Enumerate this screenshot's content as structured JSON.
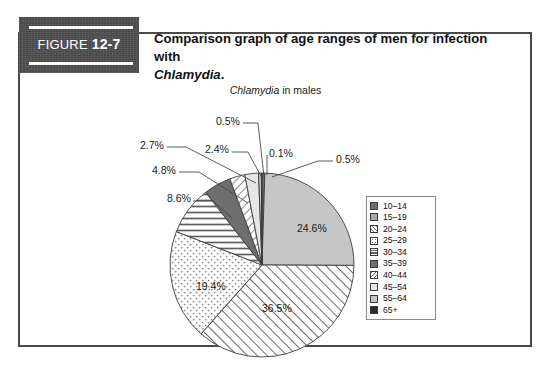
{
  "figure": {
    "tab_word": "FIGURE",
    "tab_number": "12-7",
    "caption_line1": "Comparison graph of age ranges of men for infection with",
    "caption_italic": "Chlamydia",
    "caption_end": "."
  },
  "chart_title": {
    "italic_part": "Chlamydia",
    "rest": " in males"
  },
  "chart_data": {
    "type": "pie",
    "title": "Chlamydia in males",
    "categories": [
      "10–14",
      "15–19",
      "20–24",
      "25–29",
      "30–34",
      "35–39",
      "40–44",
      "45–54",
      "55–64",
      "65+"
    ],
    "values": [
      0.5,
      24.6,
      36.5,
      19.4,
      8.6,
      4.8,
      2.7,
      2.4,
      0.5,
      0.1
    ],
    "value_labels": [
      "0.5%",
      "24.6%",
      "36.5%",
      "19.4%",
      "8.6%",
      "4.8%",
      "2.7%",
      "2.4%",
      "0.5%",
      "0.1%"
    ],
    "units": "percent",
    "legend_position": "right",
    "start_angle_deg": 0,
    "direction": "clockwise",
    "fills": [
      "dark-gray-solid",
      "light-gray-solid",
      "diagonal-hatch",
      "dotted",
      "horizontal-lines",
      "dark-gray-solid",
      "back-diagonal-hatch",
      "very-light-solid",
      "light-gray-solid",
      "near-black-solid"
    ]
  },
  "labels": {
    "inside": [
      {
        "name": "label-24-6",
        "text": "24.6%",
        "left": 297,
        "top": 222
      },
      {
        "name": "label-36-5",
        "text": "36.5%",
        "left": 262,
        "top": 302
      },
      {
        "name": "label-19-4",
        "text": "19.4%",
        "left": 196,
        "top": 280
      }
    ],
    "callouts": [
      {
        "name": "callout-8-6",
        "text": "8.6%",
        "left": 167,
        "top": 192
      },
      {
        "name": "callout-4-8",
        "text": "4.8%",
        "left": 152,
        "top": 164
      },
      {
        "name": "callout-2-7",
        "text": "2.7%",
        "left": 140,
        "top": 139
      },
      {
        "name": "callout-2-4",
        "text": "2.4%",
        "left": 205,
        "top": 143
      },
      {
        "name": "callout-0-5-top",
        "text": "0.5%",
        "left": 216,
        "top": 115
      },
      {
        "name": "callout-0-1",
        "text": "0.1%",
        "left": 269,
        "top": 147
      },
      {
        "name": "callout-0-5-right",
        "text": "0.5%",
        "left": 336,
        "top": 153
      }
    ]
  },
  "legend": {
    "items": [
      {
        "label": "10–14",
        "swatch": "dark-gray-solid"
      },
      {
        "label": "15–19",
        "swatch": "mid-gray-solid"
      },
      {
        "label": "20–24",
        "swatch": "diagonal-hatch"
      },
      {
        "label": "25–29",
        "swatch": "dotted"
      },
      {
        "label": "30–34",
        "swatch": "horizontal-lines"
      },
      {
        "label": "35–39",
        "swatch": "dark-gray-solid"
      },
      {
        "label": "40–44",
        "swatch": "back-diagonal-hatch"
      },
      {
        "label": "45–54",
        "swatch": "very-light-solid"
      },
      {
        "label": "55–64",
        "swatch": "light-gray-solid"
      },
      {
        "label": "65+",
        "swatch": "near-black-solid"
      }
    ]
  },
  "colors": {
    "frame": "#4a4a4a",
    "tab_bg": "#4f4f4f",
    "text": "#111111",
    "light_gray": "#c6c6c6",
    "mid_gray": "#a8a8a8",
    "dark_gray": "#6e6e6e",
    "near_black": "#2b2b2b",
    "very_light": "#e6e6e6"
  }
}
